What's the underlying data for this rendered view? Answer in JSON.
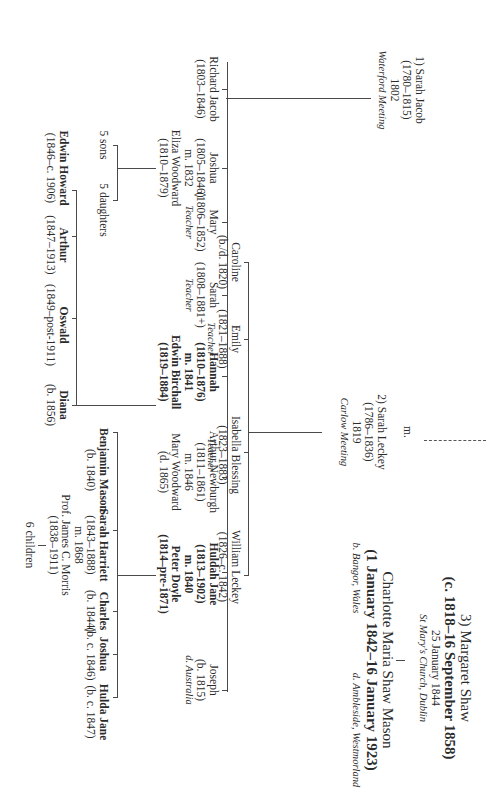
{
  "diagram": {
    "type": "family-tree",
    "orientation": "rotated-90-clockwise",
    "spouses": [
      {
        "label": "1) Sarah Jacob",
        "dates": "(1780–1815)",
        "married": "1802",
        "place": "Waterford Meeting"
      },
      {
        "label": "2) Sarah Leckey",
        "dates": "(1786–1836)",
        "married": "1819",
        "place": "Carlow Meeting"
      },
      {
        "label": "3) Margaret Shaw",
        "dates": "(c. 1818–16 September 1858)",
        "married": "25 January 1844",
        "place": "St Mary's Church, Dublin"
      }
    ],
    "marriage_marker": "m.",
    "children_of_sarah_jacob": [
      {
        "name": "Richard Jacob",
        "dates": "(1803–1846)"
      },
      {
        "name": "Joshua",
        "dates": "(1805–1846)",
        "married": "m. 1832",
        "spouse": "Eliza Woodward",
        "spouse_dates": "(1810–1879)"
      },
      {
        "name": "Mary",
        "dates": "(1806–1852)",
        "note": "Teacher"
      },
      {
        "name": "Sarah",
        "dates": "(1808–1881+)",
        "note": "Teacher"
      },
      {
        "name": "Hannah",
        "dates": "(1810–1876)",
        "married": "m. 1841",
        "spouse": "Edwin Birchall",
        "spouse_dates": "(1819–1884)"
      },
      {
        "name": "Arthur Newburgh",
        "dates": "(1811–1861)",
        "married": "m. 1846",
        "spouse": "Mary Woodward",
        "spouse_dates": "(d. 1865)"
      },
      {
        "name": "Huldah Jane",
        "dates": "(1813–1902)",
        "married": "m. 1840",
        "spouse": "Peter Doyle",
        "spouse_dates": "(1814–pre-1871)"
      },
      {
        "name": "Joseph",
        "dates": "(b. 1815)",
        "note": "d. Australia"
      }
    ],
    "children_of_sarah_leckey": [
      {
        "name": "Caroline",
        "dates": "(b./d. 1820)"
      },
      {
        "name": "Emily",
        "dates": "(1821–1888)",
        "note": "Teacher"
      },
      {
        "name": "Isabella Blessing",
        "dates": "(1823–1883)",
        "note": "Teacher"
      },
      {
        "name": "William Leckey",
        "dates": "(1826–c. 1842)"
      }
    ],
    "child_of_margaret_shaw": {
      "name": "Charlotte Maria Shaw Mason",
      "dates": "(1 January 1842–16 January 1923)",
      "born": "b. Bangor, Wales",
      "died": "d. Ambleside, Westmorland"
    },
    "joshua_children": {
      "sons": "5 sons",
      "daughters": "5 daughters"
    },
    "hannah_children": [
      {
        "name": "Edwin Howard",
        "dates": "(1846–c. 1906)"
      },
      {
        "name": "Arthur",
        "dates": "(1847–1913)"
      },
      {
        "name": "Oswald",
        "dates": "(1849–post-1911)"
      },
      {
        "name": "Diana",
        "dates": "(b. 1856)"
      }
    ],
    "huldah_children": [
      {
        "name": "Benjamin Mason",
        "dates": "(b. 1840)"
      },
      {
        "name": "Sarah Harriett",
        "dates": "(1843–1888)",
        "married": "m. 1868",
        "spouse": "Prof. James C. Morris",
        "spouse_dates": "(1838–1911)",
        "children": "6 children"
      },
      {
        "name": "Charles",
        "dates": "(b. 1844)"
      },
      {
        "name": "Joshua",
        "dates": "(b. c. 1846)"
      },
      {
        "name": "Hulda Jane",
        "dates": "(b. c. 1847)"
      }
    ]
  }
}
